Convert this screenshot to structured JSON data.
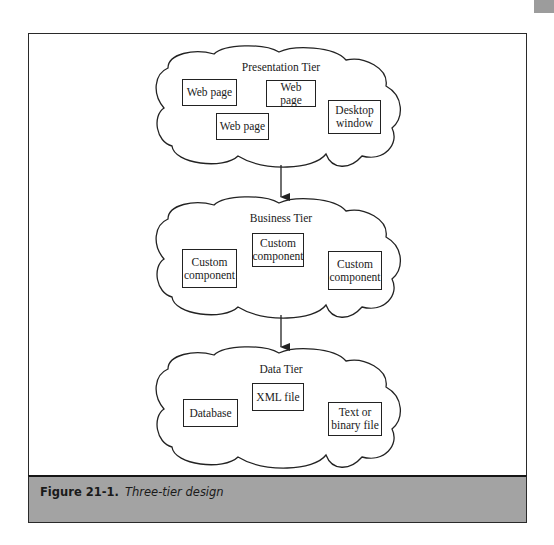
{
  "figure": {
    "label": "Figure 21-1.",
    "caption": "Three-tier design"
  },
  "tiers": [
    {
      "title": "Presentation Tier",
      "components": [
        {
          "label": "Web page"
        },
        {
          "label": "Web page"
        },
        {
          "label": "Web page"
        },
        {
          "label": "Desktop\nwindow"
        }
      ]
    },
    {
      "title": "Business Tier",
      "components": [
        {
          "label": "Custom\ncomponent"
        },
        {
          "label": "Custom\ncomponent"
        },
        {
          "label": "Custom\ncomponent"
        }
      ]
    },
    {
      "title": "Data Tier",
      "components": [
        {
          "label": "Database"
        },
        {
          "label": "XML file"
        },
        {
          "label": "Text or\nbinary file"
        }
      ]
    }
  ],
  "connections": [
    {
      "from": "Presentation Tier",
      "to": "Business Tier"
    },
    {
      "from": "Business Tier",
      "to": "Data Tier"
    }
  ],
  "colors": {
    "caption_band": "#a3a3a3",
    "stroke": "#222222",
    "corner_tab": "#9c9c9c"
  }
}
